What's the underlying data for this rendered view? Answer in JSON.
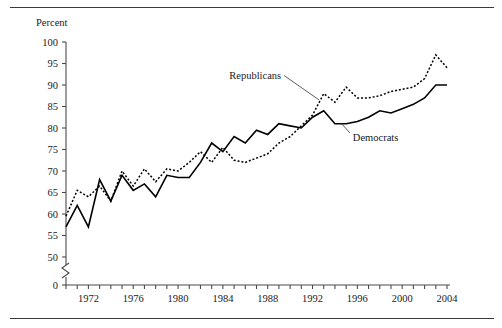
{
  "figure": {
    "has_top_rule": true,
    "has_bottom_rule": true,
    "background": "#ffffff",
    "ink_color": "#000000"
  },
  "chart_data": {
    "type": "line",
    "title": "",
    "subtitle": "",
    "xlabel": "",
    "ylabel": "Percent",
    "ylim": [
      0,
      100
    ],
    "xlim": [
      1970,
      2004
    ],
    "grid": false,
    "legend_position": "inline-annotations",
    "y_axis_break": true,
    "y_break_between": [
      0,
      50
    ],
    "yticks": [
      0,
      50,
      55,
      60,
      65,
      70,
      75,
      80,
      85,
      90,
      95,
      100
    ],
    "ytick_labels": [
      "0",
      "50",
      "55",
      "60",
      "65",
      "70",
      "75",
      "80",
      "85",
      "90",
      "95",
      "100"
    ],
    "xticks": [
      1970,
      1971,
      1972,
      1973,
      1974,
      1975,
      1976,
      1977,
      1978,
      1979,
      1980,
      1981,
      1982,
      1983,
      1984,
      1985,
      1986,
      1987,
      1988,
      1989,
      1990,
      1991,
      1992,
      1993,
      1994,
      1995,
      1996,
      1997,
      1998,
      1999,
      2000,
      2001,
      2002,
      2003,
      2004
    ],
    "xtick_labels": [
      "1972",
      "1976",
      "1980",
      "1984",
      "1988",
      "1992",
      "1996",
      "2000",
      "2004"
    ],
    "xtick_labeled_values": [
      1972,
      1976,
      1980,
      1984,
      1988,
      1992,
      1996,
      2000,
      2004
    ],
    "x": [
      1970,
      1971,
      1972,
      1973,
      1974,
      1975,
      1976,
      1977,
      1978,
      1979,
      1980,
      1981,
      1982,
      1983,
      1984,
      1985,
      1986,
      1987,
      1988,
      1989,
      1990,
      1991,
      1992,
      1993,
      1994,
      1995,
      1996,
      1997,
      1998,
      1999,
      2000,
      2001,
      2002,
      2003,
      2004
    ],
    "series": [
      {
        "name": "Republicans",
        "style": "dotted",
        "label_position": {
          "x": 1989.2,
          "y": 91.5
        },
        "leader_to": {
          "x": 1992.6,
          "y": 86.5
        },
        "values": [
          59.5,
          65.5,
          64.0,
          66.5,
          63.0,
          70.0,
          66.5,
          70.5,
          67.5,
          70.5,
          70.0,
          72.0,
          74.5,
          72.0,
          75.5,
          72.5,
          72.0,
          73.0,
          74.0,
          76.5,
          78.0,
          80.5,
          83.0,
          88.0,
          86.0,
          89.5,
          87.0,
          87.0,
          87.5,
          88.5,
          89.0,
          89.5,
          91.5,
          97.0,
          94.0
        ]
      },
      {
        "name": "Democrats",
        "style": "solid",
        "label_position": {
          "x": 1995.6,
          "y": 77.0
        },
        "leader_to": {
          "x": 1994.6,
          "y": 81.0
        },
        "values": [
          57.0,
          62.0,
          57.0,
          68.0,
          63.0,
          69.0,
          65.5,
          67.0,
          64.0,
          69.0,
          68.5,
          68.5,
          72.0,
          76.5,
          74.5,
          78.0,
          76.5,
          79.5,
          78.5,
          81.0,
          80.5,
          80.0,
          82.5,
          84.0,
          81.0,
          81.0,
          81.5,
          82.5,
          84.0,
          83.5,
          84.5,
          85.5,
          87.0,
          90.0,
          90.0
        ]
      }
    ],
    "annotations": [
      {
        "text": "Republicans",
        "series": "Republicans"
      },
      {
        "text": "Democrats",
        "series": "Democrats"
      }
    ]
  }
}
